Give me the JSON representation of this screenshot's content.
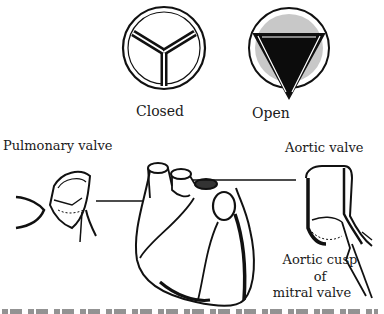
{
  "figure": {
    "valve_states": [
      {
        "id": "closed",
        "label": "Closed"
      },
      {
        "id": "open",
        "label": "Open"
      }
    ],
    "callouts": {
      "pulmonary_valve": "Pulmonary valve",
      "aortic_valve": "Aortic valve",
      "aortic_cusp_line1": "Aortic cusp",
      "aortic_cusp_line2": "of",
      "aortic_cusp_line3": "mitral valve"
    },
    "colors": {
      "ink": "#111111",
      "paper": "#ffffff",
      "shade": "#bdbdbd"
    }
  }
}
